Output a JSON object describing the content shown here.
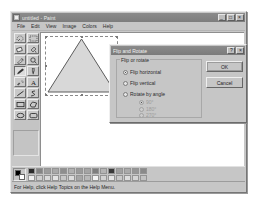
{
  "window": {
    "title": "untitled - Paint",
    "icon": "paint-app-icon",
    "buttons": {
      "minimize": "minimize-icon",
      "maximize": "maximize-icon",
      "close": "close-icon"
    }
  },
  "menubar": {
    "items": [
      {
        "label": "File"
      },
      {
        "label": "Edit"
      },
      {
        "label": "View"
      },
      {
        "label": "Image"
      },
      {
        "label": "Colors"
      },
      {
        "label": "Help"
      }
    ]
  },
  "toolbox": {
    "tools": [
      {
        "name": "free-form-select-tool",
        "selected": false
      },
      {
        "name": "rectangular-select-tool",
        "selected": false
      },
      {
        "name": "eraser-tool",
        "selected": false
      },
      {
        "name": "fill-with-color-tool",
        "selected": false
      },
      {
        "name": "pick-color-tool",
        "selected": false
      },
      {
        "name": "magnifier-tool",
        "selected": false
      },
      {
        "name": "pencil-tool",
        "selected": true
      },
      {
        "name": "brush-tool",
        "selected": false
      },
      {
        "name": "airbrush-tool",
        "selected": false
      },
      {
        "name": "text-tool",
        "selected": false
      },
      {
        "name": "line-tool",
        "selected": false
      },
      {
        "name": "curve-tool",
        "selected": false
      },
      {
        "name": "rectangle-tool",
        "selected": false
      },
      {
        "name": "polygon-tool",
        "selected": false
      },
      {
        "name": "ellipse-tool",
        "selected": false
      },
      {
        "name": "rounded-rectangle-tool",
        "selected": false
      }
    ]
  },
  "canvas": {
    "shape": "triangle",
    "selection_active": true,
    "shape_fill": "#d8d8d8",
    "shape_stroke": "#5c5c5c"
  },
  "dialog": {
    "title": "Flip and Rotate",
    "help_button": "?",
    "close_button": "×",
    "group_label": "Flip or rotate",
    "options": [
      {
        "label": "Flip horizontal",
        "checked": true,
        "disabled": false
      },
      {
        "label": "Flip vertical",
        "checked": false,
        "disabled": false
      },
      {
        "label": "Rotate by angle",
        "checked": false,
        "disabled": false
      }
    ],
    "angles": [
      {
        "label": "90°",
        "checked": true,
        "disabled": true
      },
      {
        "label": "180°",
        "checked": false,
        "disabled": true
      },
      {
        "label": "270°",
        "checked": false,
        "disabled": true
      }
    ],
    "ok_label": "OK",
    "cancel_label": "Cancel"
  },
  "palette": {
    "foreground_color": "#000000",
    "background_color": "#ffffff",
    "swatches_row1": [
      "#2b2b2b",
      "#848484",
      "#9c9c9c",
      "#a8a8a8",
      "#8e8e8e",
      "#b0b0b0",
      "#9a9a9a",
      "#a4a4a4",
      "#7e7e7e",
      "#b4b4b4",
      "#3a3a3a",
      "#a0a0a0",
      "#aaaaaa",
      "#969696",
      "#8a8a8a"
    ],
    "swatches_row2": [
      "#f0f0f0",
      "#cfcfcf",
      "#d9d9d9",
      "#e2e2e2",
      "#c7c7c7",
      "#dcdcdc",
      "#a6a6a6",
      "#b8b8b8",
      "#f4f4f4",
      "#d2d2d2",
      "#e6e6e6",
      "#cacaca",
      "#dddddd",
      "#d4d4d4",
      "#c2c2c2"
    ]
  },
  "statusbar": {
    "hint": "For Help, click Help Topics on the Help Menu."
  }
}
